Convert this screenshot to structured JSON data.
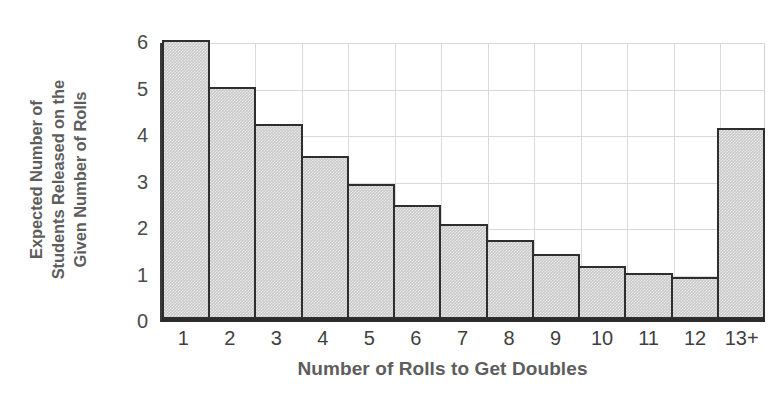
{
  "chart_data": {
    "type": "bar",
    "title": "",
    "xlabel": "Number of Rolls to Get Doubles",
    "ylabel": "Expected Number of Students Released on the Given Number of Rolls",
    "ylabel_lines": [
      "Expected Number of",
      "Students Released on the",
      "Given Number of Rolls"
    ],
    "categories": [
      "1",
      "2",
      "3",
      "4",
      "5",
      "6",
      "7",
      "8",
      "9",
      "10",
      "11",
      "12",
      "13+"
    ],
    "values": [
      6.0,
      5.0,
      4.2,
      3.5,
      2.9,
      2.45,
      2.05,
      1.7,
      1.4,
      1.15,
      1.0,
      0.9,
      4.1
    ],
    "ylim": [
      0,
      6
    ],
    "yticks": [
      "0",
      "1",
      "2",
      "3",
      "4",
      "5",
      "6"
    ],
    "ytick_values": [
      0,
      1,
      2,
      3,
      4,
      5,
      6
    ],
    "grid": true,
    "legend": "none",
    "colors": {
      "bar_fill": "#c9c9c9",
      "bar_border": "#2e2e2e",
      "gridline": "#d9d9d9",
      "axis": "#2b2b2b",
      "tick_text": "#3f3f3f",
      "axis_title_text": "#5d5d5d",
      "background": "#ffffff"
    }
  }
}
